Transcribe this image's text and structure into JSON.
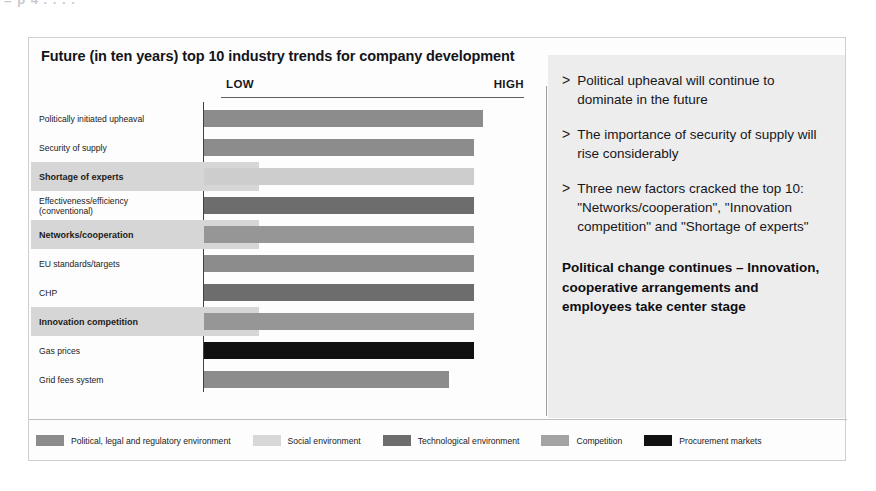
{
  "scan_artifacts": [
    "= p 4     . . .                    ."
  ],
  "slide": {
    "title": "Future (in ten years) top 10 industry trends for company development"
  },
  "chart_data": {
    "type": "bar",
    "orientation": "horizontal",
    "title": "Future (in ten years) top 10 industry trends for company development",
    "xlabel": "",
    "ylabel": "",
    "grid": false,
    "axis_low_label": "LOW",
    "axis_high_label": "HIGH",
    "xlim": [
      0,
      100
    ],
    "legend_position": "bottom",
    "categories": [
      "Politically initiated upheaval",
      "Security of supply",
      "Shortage of experts",
      "Effectiveness/efficiency (conventional)",
      "Networks/cooperation",
      "EU standards/targets",
      "CHP",
      "Innovation competition",
      "Gas prices",
      "Grid fees system"
    ],
    "values": [
      92,
      89,
      89,
      89,
      89,
      89,
      89,
      89,
      89,
      81
    ],
    "series": [
      {
        "name": "Top 10 industry trends",
        "values": [
          92,
          89,
          89,
          89,
          89,
          89,
          89,
          89,
          89,
          81
        ]
      }
    ],
    "bars": [
      {
        "label": "Politically initiated upheaval",
        "label_lines": [
          "Politically initiated upheaval"
        ],
        "value": 92,
        "category": "Political, legal and regulatory environment",
        "color": "#8c8c8c",
        "highlighted": false
      },
      {
        "label": "Security of supply",
        "label_lines": [
          "Security of supply"
        ],
        "value": 89,
        "category": "Political, legal and regulatory environment",
        "color": "#8c8c8c",
        "highlighted": false
      },
      {
        "label": "Shortage of experts",
        "label_lines": [
          "Shortage of experts"
        ],
        "value": 89,
        "category": "Social environment",
        "color": "#cdcdcd",
        "highlighted": true
      },
      {
        "label": "Effectiveness/efficiency (conventional)",
        "label_lines": [
          "Effectiveness/efficiency",
          "(conventional)"
        ],
        "value": 89,
        "category": "Technological environment",
        "color": "#6d6d6d",
        "highlighted": false
      },
      {
        "label": "Networks/cooperation",
        "label_lines": [
          "Networks/cooperation"
        ],
        "value": 89,
        "category": "Competition",
        "color": "#969696",
        "highlighted": true
      },
      {
        "label": "EU standards/targets",
        "label_lines": [
          "EU standards/targets"
        ],
        "value": 89,
        "category": "Political, legal and regulatory environment",
        "color": "#8c8c8c",
        "highlighted": false
      },
      {
        "label": "CHP",
        "label_lines": [
          "CHP"
        ],
        "value": 89,
        "category": "Technological environment",
        "color": "#6d6d6d",
        "highlighted": false
      },
      {
        "label": "Innovation competition",
        "label_lines": [
          "Innovation competition"
        ],
        "value": 89,
        "category": "Competition",
        "color": "#969696",
        "highlighted": true
      },
      {
        "label": "Gas prices",
        "label_lines": [
          "Gas prices"
        ],
        "value": 89,
        "category": "Procurement markets",
        "color": "#111111",
        "highlighted": false
      },
      {
        "label": "Grid fees system",
        "label_lines": [
          "Grid fees system"
        ],
        "value": 81,
        "category": "Political, legal and regulatory environment",
        "color": "#8c8c8c",
        "highlighted": false
      }
    ],
    "legend": [
      {
        "label": "Political, legal and regulatory environment",
        "color": "#8c8c8c"
      },
      {
        "label": "Social environment",
        "color": "#d8d8d8"
      },
      {
        "label": "Technological environment",
        "color": "#6d6d6d"
      },
      {
        "label": "Competition",
        "color": "#a3a3a3"
      },
      {
        "label": "Procurement markets",
        "color": "#111111"
      }
    ]
  },
  "commentary": {
    "bullet_marker": ">",
    "bullets": [
      "Political upheaval will continue to dominate in the future",
      "The importance of security of supply will rise considerably",
      "Three new factors cracked the top 10: \"Networks/cooperation\", \"Innovation competition\" and \"Shortage of experts\""
    ],
    "conclusion": "Political change continues – Innovation, cooperative arrangements and employees take center stage"
  }
}
